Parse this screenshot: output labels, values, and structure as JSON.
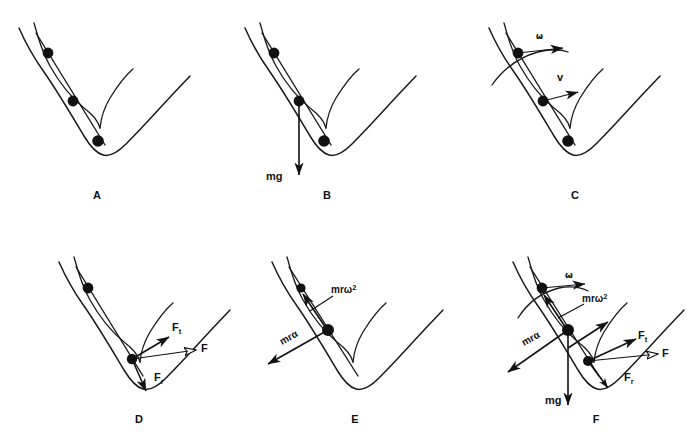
{
  "figure": {
    "background_color": "#ffffff",
    "ink_color": "#111111",
    "width": 692,
    "height": 438
  },
  "panels": [
    {
      "id": "A",
      "letter": "A",
      "letter_x": 97,
      "letter_y": 199,
      "beads": 3,
      "vectors": []
    },
    {
      "id": "B",
      "letter": "B",
      "letter_x": 327,
      "letter_y": 199,
      "beads": 3,
      "vectors": [
        {
          "name": "weight",
          "label": "mg",
          "label_x": 268,
          "label_y": 180,
          "direction": "down"
        }
      ]
    },
    {
      "id": "C",
      "letter": "C",
      "letter_x": 575,
      "letter_y": 199,
      "beads": 3,
      "vectors": [
        {
          "name": "angular-velocity",
          "label": "ω",
          "label_x": 539,
          "label_y": 38,
          "direction": "right"
        },
        {
          "name": "linear-velocity",
          "label": "v",
          "label_x": 561,
          "label_y": 80,
          "direction": "right-down"
        }
      ]
    },
    {
      "id": "D",
      "letter": "D",
      "letter_x": 139,
      "letter_y": 423,
      "beads": 2,
      "vectors": [
        {
          "name": "tangential-force",
          "label": "F",
          "sub": "t",
          "label_x": 175,
          "label_y": 329,
          "direction": "up-right"
        },
        {
          "name": "resultant-force",
          "label": "F",
          "sub": "",
          "label_x": 204,
          "label_y": 350,
          "direction": "right"
        },
        {
          "name": "radial-force",
          "label": "F",
          "sub": "r",
          "label_x": 158,
          "label_y": 379,
          "direction": "down-left"
        }
      ]
    },
    {
      "id": "E",
      "letter": "E",
      "letter_x": 355,
      "letter_y": 423,
      "beads": 2,
      "vectors": [
        {
          "name": "centripetal-term",
          "label": "mrω²",
          "label_x": 333,
          "label_y": 294,
          "direction": "up-left"
        },
        {
          "name": "tangential-term",
          "label": "mrα",
          "label_x": 281,
          "label_y": 345,
          "direction": "down-left",
          "rotated": true
        }
      ]
    },
    {
      "id": "F",
      "letter": "F",
      "letter_x": 596,
      "letter_y": 423,
      "beads": 3,
      "vectors": [
        {
          "name": "angular-velocity",
          "label": "ω",
          "label_x": 568,
          "label_y": 278,
          "direction": "right"
        },
        {
          "name": "centripetal-term",
          "label": "mrω²",
          "label_x": 584,
          "label_y": 302,
          "direction": "up-left"
        },
        {
          "name": "tangential-term",
          "label": "mrα",
          "label_x": 525,
          "label_y": 345,
          "direction": "down-left",
          "rotated": true
        },
        {
          "name": "weight",
          "label": "mg",
          "label_x": 548,
          "label_y": 403,
          "direction": "down"
        },
        {
          "name": "tangential-force",
          "label": "F",
          "sub": "t",
          "label_x": 642,
          "label_y": 338,
          "direction": "up-right"
        },
        {
          "name": "resultant-force",
          "label": "F",
          "sub": "",
          "label_x": 665,
          "label_y": 355,
          "direction": "right"
        },
        {
          "name": "radial-force",
          "label": "F",
          "sub": "r",
          "label_x": 628,
          "label_y": 378,
          "direction": "down-left"
        }
      ]
    }
  ],
  "labels": {
    "omega": "ω",
    "alpha": "α",
    "velocity": "v",
    "weight": "mg",
    "force": "F",
    "force_tangential_base": "F",
    "force_tangential_sub": "t",
    "force_radial_base": "F",
    "force_radial_sub": "r",
    "mr_prefix": "mr",
    "superscript_two": "2"
  },
  "caption": {
    "partial_clipped_text": ""
  }
}
